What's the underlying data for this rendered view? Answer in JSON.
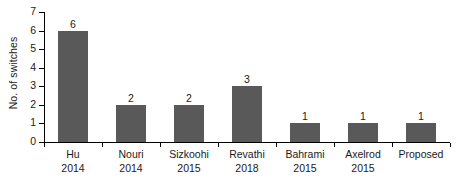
{
  "chart_data": {
    "type": "bar",
    "title": "",
    "xlabel": "",
    "ylabel": "No. of switches",
    "categories": [
      "Hu\n2014",
      "Nouri\n2014",
      "Sizkoohi\n2015",
      "Revathi\n2018",
      "Bahrami\n2015",
      "Axelrod\n2015",
      "Proposed"
    ],
    "category_names": [
      "Hu",
      "Nouri",
      "Sizkoohi",
      "Revathi",
      "Bahrami",
      "Axelrod",
      "Proposed"
    ],
    "category_years": [
      "2014",
      "2014",
      "2015",
      "2018",
      "2015",
      "2015",
      ""
    ],
    "values": [
      6,
      2,
      2,
      3,
      1,
      1,
      1
    ],
    "data_labels": [
      "6",
      "2",
      "2",
      "3",
      "1",
      "1",
      "1"
    ],
    "ylim": [
      0,
      7
    ],
    "ytick_values": [
      0,
      1,
      2,
      3,
      4,
      5,
      6,
      7
    ],
    "ytick_labels": [
      "0",
      "1",
      "2",
      "3",
      "4",
      "5",
      "6",
      "7"
    ],
    "grid": false,
    "legend": false,
    "legend_position": "none",
    "bar_color": "#595959",
    "axis_color": "#000000",
    "text_color": "#1a1a1a",
    "background_color": "#ffffff"
  }
}
